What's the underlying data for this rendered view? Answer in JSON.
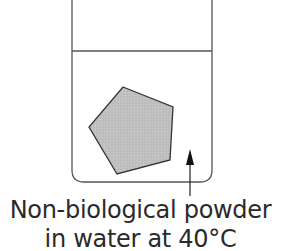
{
  "diagram": {
    "beaker": {
      "left_x": 72,
      "right_x": 212,
      "top_y": 0,
      "bottom_y": 182,
      "corner_radius": 12,
      "stroke": "#555555"
    },
    "water_line_y": 51,
    "object": {
      "shape": "pentagon",
      "points": "123,87 173,107 170,160 117,174 89,127",
      "fill": "#bdbdbd",
      "stroke": "#333333"
    },
    "arrow": {
      "x": 190,
      "tip_y": 149,
      "tail_y": 196,
      "color": "#111111"
    },
    "label": {
      "line1": "Non-biological powder",
      "line2": "in water at 40°C"
    }
  }
}
